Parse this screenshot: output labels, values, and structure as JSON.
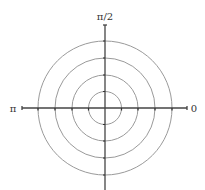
{
  "diagram": {
    "type": "polar-grid",
    "center": {
      "x": 105,
      "y": 108
    },
    "rings": [
      16.5,
      33,
      50,
      67
    ],
    "colors": {
      "ring": "#9a9a9a",
      "axis": "#444444",
      "tick": "#333333",
      "label": "#333333"
    },
    "labels": {
      "top": "π/2",
      "left": "π",
      "right": "0"
    }
  }
}
